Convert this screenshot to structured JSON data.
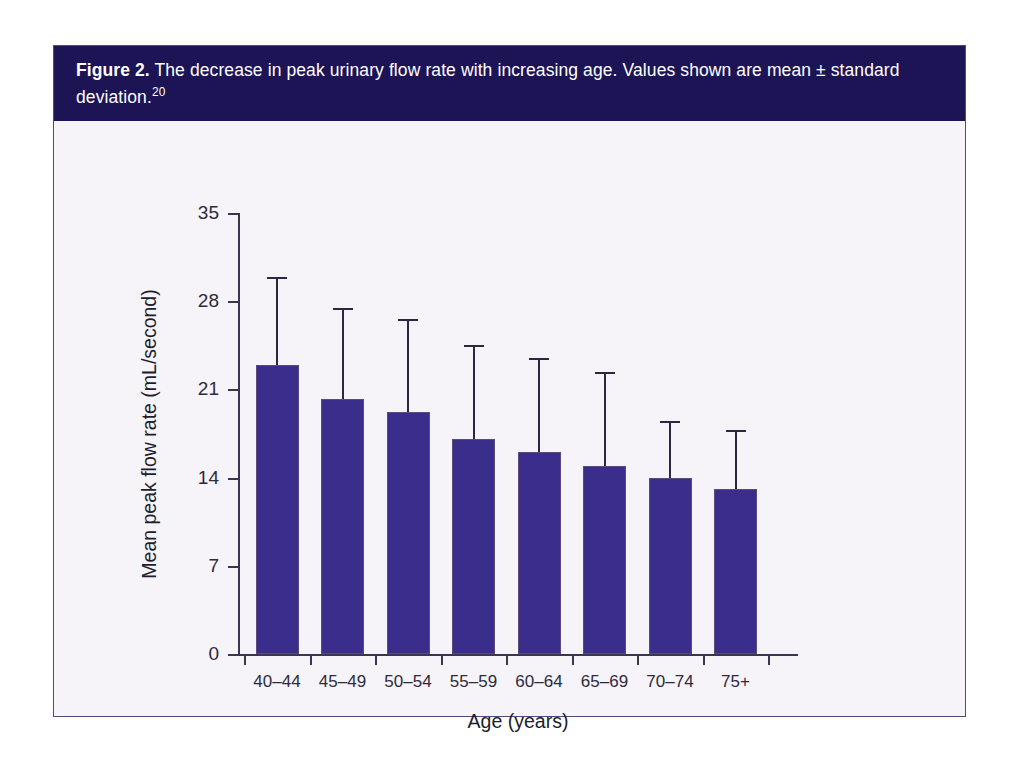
{
  "figure": {
    "label": "Figure 2.",
    "caption": " The decrease in peak urinary flow rate with increasing age. Values shown are mean ± standard deviation.",
    "reference": "20"
  },
  "colors": {
    "banner_background": "#1d1456",
    "banner_text": "#ffffff",
    "bar_fill": "#3a2d8b",
    "axis": "#3b3550",
    "plot_background": "#f6f4f8",
    "frame_border": "#544a7a"
  },
  "chart_data": {
    "type": "bar",
    "title": "The decrease in peak urinary flow rate with increasing age",
    "xlabel": "Age (years)",
    "ylabel": "Mean peak flow rate (mL/second)",
    "categories": [
      "40–44",
      "45–49",
      "50–54",
      "55–59",
      "60–64",
      "65–69",
      "70–74",
      "75+"
    ],
    "values": [
      22.9,
      20.2,
      19.2,
      17.1,
      16.0,
      14.9,
      14.0,
      13.1
    ],
    "error_upper": [
      29.9,
      27.5,
      26.6,
      24.5,
      23.5,
      22.4,
      18.5,
      17.8
    ],
    "error_sd": [
      7.0,
      7.3,
      7.4,
      7.4,
      7.5,
      7.5,
      4.5,
      4.7
    ],
    "error_style": "upper-only standard deviation whisker",
    "ylim": [
      0,
      35
    ],
    "yticks": [
      0,
      7,
      14,
      21,
      28,
      35
    ],
    "ytick_labels": [
      "0",
      "7",
      "14",
      "21",
      "28",
      "35"
    ],
    "grid": false,
    "legend": false
  }
}
